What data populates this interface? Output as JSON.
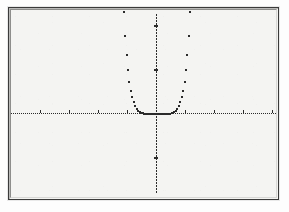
{
  "window": {
    "title": "Graphing Calculator Plot",
    "background_color": "#f4f4f2",
    "frame_color": "#3a3a3a",
    "ink_color": "#2b2b2b"
  },
  "graph": {
    "label": "graph-display",
    "axis_style": "dotted",
    "point_style": "pixel-dots"
  },
  "chart_data": {
    "type": "scatter",
    "title": "",
    "subtitle": "",
    "xlabel": "",
    "ylabel": "",
    "grid": false,
    "legend": null,
    "legend_position": "none",
    "axes": {
      "x_axis_visible": true,
      "y_axis_visible": true,
      "x_axis_pixel_y": 105,
      "y_axis_pixel_x": 147,
      "x_tick_spacing_px": 29,
      "y_tick_spacing_px": 44,
      "style": "dotted"
    },
    "xlim": [
      -4.7,
      4.7
    ],
    "ylim": [
      -3.1,
      3.1
    ],
    "xticks": [
      -4,
      -3,
      -2,
      -1,
      1,
      2,
      3,
      4
    ],
    "yticks": [
      -2,
      -1,
      1,
      2
    ],
    "xticklabels": [
      "",
      "",
      "",
      "",
      "",
      "",
      "",
      ""
    ],
    "yticklabels": [
      "",
      "",
      "",
      ""
    ],
    "series": [
      {
        "name": "y = x^6",
        "color": "#2b2b2b",
        "marker": "pixel",
        "x": [
          -2.6,
          -2.55,
          -2.5,
          -2.45,
          -2.4,
          -2.35,
          -2.3,
          -2.25,
          -2.2,
          -2.15,
          -2.1,
          -2.05,
          -2.0,
          -1.95,
          -1.9,
          -1.85,
          -1.8,
          -1.75,
          -1.7,
          -1.65,
          -1.6,
          -1.55,
          -1.5,
          -1.45,
          -1.4,
          -1.35,
          -1.3,
          -1.25,
          -1.2,
          -1.15,
          -1.1,
          -1.05,
          -1.0,
          -0.95,
          -0.9,
          -0.85,
          -0.8,
          -0.75,
          -0.7,
          -0.65,
          -0.6,
          -0.55,
          -0.5,
          -0.45,
          -0.4,
          -0.35,
          -0.3,
          -0.25,
          -0.2,
          -0.15,
          -0.1,
          -0.05,
          0.0,
          0.05,
          0.1,
          0.15,
          0.2,
          0.25,
          0.3,
          0.35,
          0.4,
          0.45,
          0.5,
          0.55,
          0.6,
          0.65,
          0.7,
          0.75,
          0.8,
          0.85,
          0.9,
          0.95,
          1.0,
          1.05,
          1.1,
          1.15,
          1.2,
          1.25,
          1.3,
          1.35,
          1.4,
          1.45,
          1.5,
          1.55,
          1.6,
          1.65,
          1.7,
          1.75,
          1.8,
          1.85,
          1.9,
          1.95,
          2.0,
          2.05,
          2.1,
          2.15,
          2.2,
          2.25,
          2.3,
          2.35,
          2.4,
          2.45,
          2.5,
          2.55,
          2.6
        ],
        "y_note": "y = x^6 clipped to ylim top of 3.1; flat along axis for |x| < 1"
      }
    ],
    "annotations": []
  }
}
